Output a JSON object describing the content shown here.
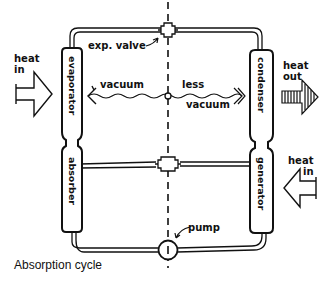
{
  "caption": "Absorption cycle",
  "components": {
    "evaporator": "evaporator",
    "absorber": "absorber",
    "condenser": "condenser",
    "generator": "generator",
    "expansion_valve": "exp. valve",
    "pump": "pump"
  },
  "regions": {
    "left": "vacuum",
    "right_line1": "less",
    "right_line2": "vacuum"
  },
  "heat_flows": {
    "evaporator_in": {
      "line1": "heat",
      "line2": "in"
    },
    "condenser_out": {
      "line1": "heat",
      "line2": "out"
    },
    "generator_in": {
      "line1": "heat",
      "line2": "in"
    }
  },
  "colors": {
    "ink": "#111111",
    "background": "#ffffff"
  }
}
